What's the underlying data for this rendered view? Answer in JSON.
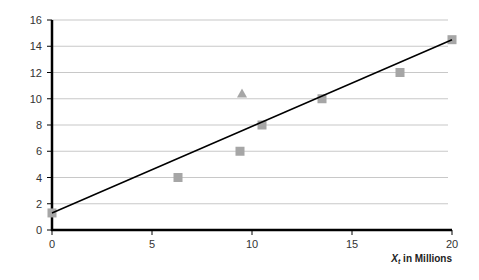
{
  "chart_data": {
    "type": "scatter",
    "title": "",
    "xlabel": "X_t in Millions",
    "xlabel_main": "X",
    "xlabel_sub": "t",
    "xlabel_rest": " in Millions",
    "ylabel": "",
    "xlim": [
      0,
      20
    ],
    "ylim": [
      0,
      16
    ],
    "x_ticks": [
      0,
      5,
      10,
      15,
      20
    ],
    "y_ticks": [
      0,
      2,
      4,
      6,
      8,
      10,
      12,
      14,
      16
    ],
    "grid": "horizontal",
    "series": [
      {
        "name": "observations",
        "marker": "square",
        "color": "#a6a6a6",
        "points": [
          [
            0,
            1.3
          ],
          [
            6.3,
            4
          ],
          [
            9.4,
            6
          ],
          [
            10.5,
            8
          ],
          [
            13.5,
            10
          ],
          [
            17.4,
            12
          ],
          [
            20,
            14.5
          ]
        ]
      },
      {
        "name": "outlier",
        "marker": "triangle",
        "color": "#a6a6a6",
        "points": [
          [
            9.5,
            10.4
          ]
        ]
      },
      {
        "name": "fitted line",
        "type": "line",
        "color": "#000000",
        "points": [
          [
            0,
            1.3
          ],
          [
            20,
            14.5
          ]
        ]
      }
    ]
  }
}
